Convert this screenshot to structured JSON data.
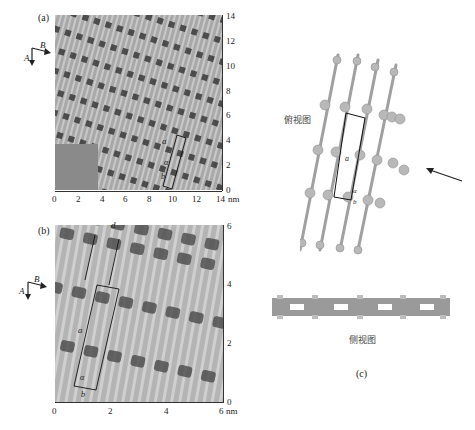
{
  "figure": {
    "panel_a": {
      "label": "(a)",
      "x_ticks": [
        "0",
        "2",
        "4",
        "6",
        "8",
        "10",
        "12",
        "14"
      ],
      "y_ticks": [
        "0",
        "2",
        "4",
        "6",
        "8",
        "10",
        "12",
        "14"
      ],
      "unit": "nm",
      "direction_labels": {
        "A": "A",
        "B": "B"
      },
      "cell_labels": {
        "a": "a",
        "alpha": "α",
        "b": "b"
      }
    },
    "panel_b": {
      "label": "(b)",
      "x_ticks": [
        "0",
        "2",
        "4",
        "6"
      ],
      "y_ticks": [
        "0",
        "2",
        "4",
        "6"
      ],
      "unit": "nm",
      "direction_labels": {
        "A": "A",
        "B": "B"
      },
      "cell_labels": {
        "a": "a",
        "alpha": "α",
        "b": "b",
        "d": "d"
      }
    },
    "panel_c": {
      "label": "(c)",
      "top_view_label": "俯视图",
      "side_view_label": "侧视图",
      "cell_labels": {
        "a": "a",
        "alpha": "α",
        "b": "b"
      }
    }
  }
}
